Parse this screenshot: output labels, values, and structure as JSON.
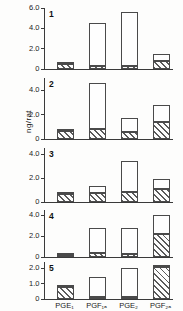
{
  "chart_data": {
    "type": "bar",
    "title": "",
    "xlabel": "",
    "ylabel": "ng/rat",
    "categories": [
      "PGE1",
      "PGF1a",
      "PGE2",
      "PGF2a"
    ],
    "category_labels_html": [
      "PGE₁",
      "PGF₁ₐ",
      "PGE₂",
      "PGF₂ₐ"
    ],
    "stacked": true,
    "series": [
      {
        "name": "hatched",
        "fill": "diagonal-hatch"
      },
      {
        "name": "open",
        "fill": "open"
      }
    ],
    "panels": [
      {
        "number": "1",
        "ylim": [
          0,
          6.0
        ],
        "yticks": [
          0,
          2.0,
          4.0,
          6.0
        ],
        "ytick_labels": [
          "0",
          "2.0",
          "4.0",
          "6.0"
        ],
        "bars": [
          {
            "category": "PGE1",
            "hatched": 0.45,
            "open": 0.12,
            "total": 0.57
          },
          {
            "category": "PGF1a",
            "hatched": 0.3,
            "open": 4.2,
            "total": 4.5
          },
          {
            "category": "PGE2",
            "hatched": 0.25,
            "open": 5.35,
            "total": 5.6
          },
          {
            "category": "PGF2a",
            "hatched": 0.8,
            "open": 0.7,
            "total": 1.5
          }
        ]
      },
      {
        "number": "2",
        "ylim": [
          0,
          5.0
        ],
        "yticks": [
          0,
          2.0,
          4.0
        ],
        "ytick_labels": [
          "0",
          "2.0",
          "4.0"
        ],
        "bars": [
          {
            "category": "PGE1",
            "hatched": 0.65,
            "open": 0.05,
            "total": 0.7
          },
          {
            "category": "PGF1a",
            "hatched": 0.85,
            "open": 3.75,
            "total": 4.6
          },
          {
            "category": "PGE2",
            "hatched": 0.55,
            "open": 1.15,
            "total": 1.7
          },
          {
            "category": "PGF2a",
            "hatched": 1.4,
            "open": 1.4,
            "total": 2.8
          }
        ]
      },
      {
        "number": "3",
        "ylim": [
          0,
          4.5
        ],
        "yticks": [
          0,
          2.0,
          4.0
        ],
        "ytick_labels": [
          "0",
          "2.0",
          "4.0"
        ],
        "bars": [
          {
            "category": "PGE1",
            "hatched": 0.7,
            "open": 0.05,
            "total": 0.75
          },
          {
            "category": "PGF1a",
            "hatched": 0.75,
            "open": 0.55,
            "total": 1.3
          },
          {
            "category": "PGE2",
            "hatched": 0.8,
            "open": 2.65,
            "total": 3.45
          },
          {
            "category": "PGF2a",
            "hatched": 1.05,
            "open": 0.9,
            "total": 1.95
          }
        ]
      },
      {
        "number": "4",
        "ylim": [
          0,
          4.5
        ],
        "yticks": [
          0,
          2.0,
          4.0
        ],
        "ytick_labels": [
          "0",
          "2.0",
          "4.0"
        ],
        "bars": [
          {
            "category": "PGE1",
            "hatched": 0.15,
            "open": 0.05,
            "total": 0.2
          },
          {
            "category": "PGF1a",
            "hatched": 0.35,
            "open": 2.45,
            "total": 2.8
          },
          {
            "category": "PGE2",
            "hatched": 0.3,
            "open": 2.5,
            "total": 2.8
          },
          {
            "category": "PGF2a",
            "hatched": 2.25,
            "open": 1.75,
            "total": 4.0
          }
        ]
      },
      {
        "number": "5",
        "ylim": [
          0,
          2.4
        ],
        "yticks": [
          0,
          1.0,
          2.0
        ],
        "ytick_labels": [
          "0",
          "1.0",
          "2.0"
        ],
        "bars": [
          {
            "category": "PGE1",
            "hatched": 0.75,
            "open": 0.05,
            "total": 0.8
          },
          {
            "category": "PGF1a",
            "hatched": 0.1,
            "open": 1.3,
            "total": 1.4
          },
          {
            "category": "PGE2",
            "hatched": 0.12,
            "open": 1.9,
            "total": 2.02
          },
          {
            "category": "PGF2a",
            "hatched": 2.1,
            "open": 0.1,
            "total": 2.2
          }
        ]
      }
    ]
  }
}
